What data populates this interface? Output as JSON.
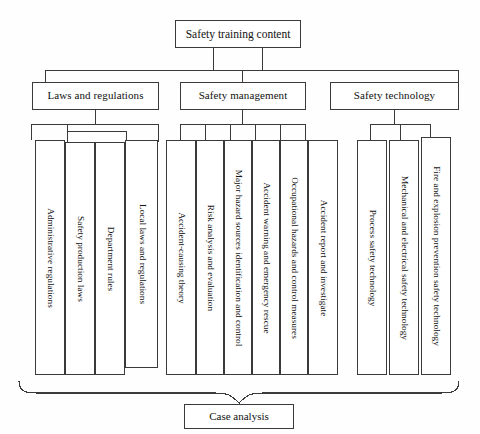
{
  "diagram": {
    "root": {
      "label": "Safety training content"
    },
    "branches": [
      {
        "label": "Laws and regulations",
        "children": [
          {
            "label": "Administrative regulations"
          },
          {
            "label": "Safety production laws"
          },
          {
            "label": "Department rules"
          },
          {
            "label": "Local laws and regulations"
          }
        ]
      },
      {
        "label": "Safety management",
        "children": [
          {
            "label": "Accident-causing theory"
          },
          {
            "label": "Risk analysis and evaluation"
          },
          {
            "label": "Major hazard sources identification and control"
          },
          {
            "label": "Accident warning and emergency rescue"
          },
          {
            "label": "Occupational hazards and control measures"
          },
          {
            "label": "Accident report and investigate"
          }
        ]
      },
      {
        "label": "Safety technology",
        "children": [
          {
            "label": "Process safety technology"
          },
          {
            "label": "Mechanical and electrical safety technology"
          },
          {
            "label": "Fire and explosion prevention safety technology"
          }
        ]
      }
    ],
    "footer": {
      "label": "Case analysis"
    },
    "colors": {
      "line": "#3a3a3a",
      "text": "#111111",
      "background": "#fefefe"
    }
  }
}
